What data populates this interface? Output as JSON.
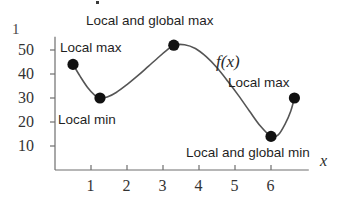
{
  "figure": {
    "corner_mark": "1",
    "function_label": "f(x)",
    "x_axis_name": "x"
  },
  "annotations": [
    {
      "id": "local-and-global-max",
      "text": "Local and global max",
      "x": 86,
      "y": 14
    },
    {
      "id": "local-max-left",
      "text": "Local max",
      "x": 60,
      "y": 41
    },
    {
      "id": "local-min",
      "text": "Local min",
      "x": 58,
      "y": 113
    },
    {
      "id": "local-max-right",
      "text": "Local max",
      "x": 228,
      "y": 76
    },
    {
      "id": "local-and-global-min",
      "text": "Local and global min",
      "x": 186,
      "y": 146
    }
  ],
  "chart_data": {
    "type": "line",
    "title": "",
    "xlabel": "x",
    "ylabel": "",
    "series_name": "f(x)",
    "grid": false,
    "legend": "none",
    "xlim": [
      0,
      7.1
    ],
    "ylim": [
      0,
      57
    ],
    "xticks": [
      1,
      2,
      3,
      4,
      5,
      6
    ],
    "xtick_labels": [
      "1",
      "2",
      "3",
      "4",
      "5",
      "6"
    ],
    "yticks": [
      10,
      20,
      30,
      40,
      50
    ],
    "ytick_labels": [
      "10",
      "20",
      "30",
      "40",
      "50"
    ],
    "marked_points": [
      {
        "label": "Local max",
        "x": 0.5,
        "y": 44
      },
      {
        "label": "Local min",
        "x": 1.25,
        "y": 30
      },
      {
        "label": "Local and global max",
        "x": 3.3,
        "y": 52
      },
      {
        "label": "Local and global min",
        "x": 6.0,
        "y": 14
      },
      {
        "label": "Local max",
        "x": 6.65,
        "y": 30
      }
    ],
    "curve_points": [
      {
        "x": 0.5,
        "y": 44.0
      },
      {
        "x": 0.7,
        "y": 39.0
      },
      {
        "x": 0.9,
        "y": 34.5
      },
      {
        "x": 1.1,
        "y": 31.2
      },
      {
        "x": 1.25,
        "y": 30.0
      },
      {
        "x": 1.45,
        "y": 30.4
      },
      {
        "x": 1.7,
        "y": 32.3
      },
      {
        "x": 2.0,
        "y": 35.6
      },
      {
        "x": 2.3,
        "y": 39.3
      },
      {
        "x": 2.6,
        "y": 43.3
      },
      {
        "x": 2.9,
        "y": 47.3
      },
      {
        "x": 3.1,
        "y": 49.8
      },
      {
        "x": 3.3,
        "y": 52.0
      },
      {
        "x": 3.6,
        "y": 52.2
      },
      {
        "x": 3.9,
        "y": 50.6
      },
      {
        "x": 4.2,
        "y": 47.2
      },
      {
        "x": 4.5,
        "y": 42.6
      },
      {
        "x": 4.8,
        "y": 37.0
      },
      {
        "x": 5.1,
        "y": 31.0
      },
      {
        "x": 5.4,
        "y": 24.6
      },
      {
        "x": 5.7,
        "y": 18.4
      },
      {
        "x": 6.0,
        "y": 14.0
      },
      {
        "x": 6.2,
        "y": 14.6
      },
      {
        "x": 6.4,
        "y": 19.4
      },
      {
        "x": 6.55,
        "y": 24.6
      },
      {
        "x": 6.65,
        "y": 30.0
      }
    ]
  },
  "style": {
    "curve_color": "#555555",
    "point_color": "#111111",
    "axis_color": "#6e6e6e",
    "text_color": "#1f1f1f"
  }
}
